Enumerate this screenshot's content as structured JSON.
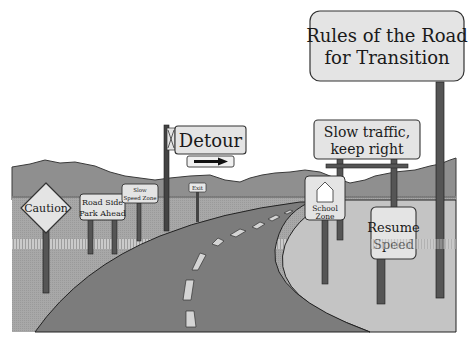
{
  "scene": {
    "title": "Rules of the Road for Transition illustration",
    "colors": {
      "background": "#ffffff",
      "mountains": "#8e8e8e",
      "field": "#b4b4b4",
      "road": "#7a7a7a",
      "road_edge": "#2a2a2a",
      "right_field": "#c8c8c8",
      "sign_face": "#e6e6e6",
      "sign_border": "#3a3a3a",
      "post": "#555555",
      "lane_marking": "#d8d8d8",
      "fence": "#c9c9c9"
    }
  },
  "signs": {
    "title_sign": {
      "line1": "Rules of the Road",
      "line2": "for Transition"
    },
    "caution": {
      "label": "Caution"
    },
    "road_side": {
      "line1": "Road Side",
      "line2": "Park Ahead"
    },
    "slow_speed_zone": {
      "line1": "Slow",
      "line2": "Speed Zone"
    },
    "detour": {
      "label": "Detour",
      "arrow": "right-arrow"
    },
    "exit": {
      "label": "Exit"
    },
    "slow_traffic": {
      "line1": "Slow traffic,",
      "line2": "keep right"
    },
    "school_zone": {
      "line1": "School",
      "line2": "Zone",
      "icon": "schoolhouse-icon"
    },
    "resume_speed": {
      "line1": "Resume",
      "line2": "Speed"
    }
  }
}
